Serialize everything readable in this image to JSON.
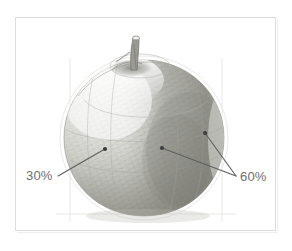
{
  "figure": {
    "medium": "graphite pencil drawing",
    "frame": {
      "border_color": "#dcdcdc",
      "background_color": "#ffffff"
    }
  },
  "callouts": [
    {
      "id": "callout-30",
      "label": "30%",
      "color": "#6e6e6e",
      "meaning": "light tonal value on the lit left side of the apple",
      "label_x": 26,
      "label_y": 169,
      "leader_lines": [
        {
          "x1": 58,
          "y1": 176,
          "x2": 105,
          "y2": 149
        }
      ],
      "target_dots": [
        {
          "x": 105,
          "y": 149
        }
      ]
    },
    {
      "id": "callout-60",
      "label": "60%",
      "color": "#6e6e6e",
      "meaning": "darker tonal value on the shaded right side of the apple",
      "label_x": 240,
      "label_y": 170,
      "leader_lines": [
        {
          "x1": 236,
          "y1": 176,
          "x2": 162,
          "y2": 148
        },
        {
          "x1": 236,
          "y1": 176,
          "x2": 205,
          "y2": 133
        }
      ],
      "target_dots": [
        {
          "x": 162,
          "y": 148
        },
        {
          "x": 205,
          "y": 133
        }
      ]
    }
  ],
  "apple": {
    "body": {
      "center_x": 144,
      "center_y": 138,
      "radius_x": 80,
      "radius_y": 78,
      "outline_color": "#b9b9b4"
    },
    "stem": {
      "x": 134,
      "y_top": 37,
      "y_bottom": 72,
      "color": "#8c8c8a"
    },
    "shading": {
      "light_side": "left",
      "shadow_side": "right",
      "light_value_percent": 30,
      "shadow_value_percent": 60,
      "graphite_light": "#cfcfc9",
      "graphite_mid": "#a8a8a2",
      "graphite_dark": "#7c7c78"
    }
  }
}
